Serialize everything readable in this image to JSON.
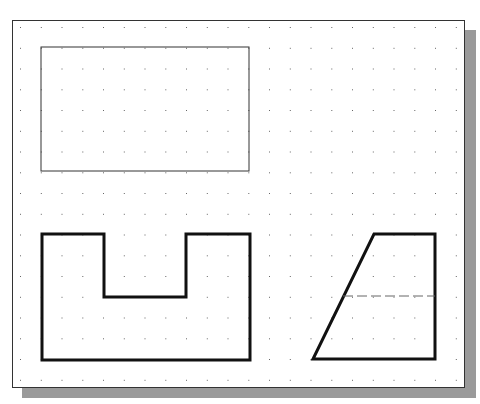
{
  "drawing": {
    "sheet": {
      "x": 12,
      "y": 20,
      "width": 453,
      "height": 368
    },
    "grid": {
      "origin_x": 20,
      "origin_y": 27,
      "spacing": 20.75,
      "cols": 22,
      "rows": 18,
      "dot_color": "#666666"
    },
    "colors": {
      "thick_line": "#111111",
      "thin_line": "#333333",
      "dashed_line": "#666666",
      "shadow": "#9a9a9a"
    },
    "shapes": {
      "thin_rectangle": {
        "x": 41,
        "y": 47,
        "width": 208,
        "height": 124
      },
      "u_profile": {
        "points": "42,234 104,234 104,297 186,297 186,234 250,234 250,360 42,360"
      },
      "trapezoid": {
        "points": "374,234 435,234 435,359 313,359"
      },
      "hidden_line": {
        "x1": 343,
        "y1": 296,
        "x2": 435,
        "y2": 296
      }
    }
  }
}
